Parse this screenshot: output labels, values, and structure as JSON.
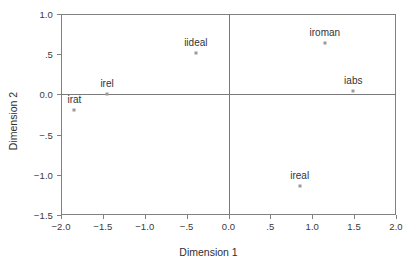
{
  "chart_data": {
    "type": "scatter",
    "title": "",
    "subtitle": "",
    "xlabel": "Dimension 1",
    "ylabel": "Dimension 2",
    "xlim": [
      -2.0,
      2.0
    ],
    "ylim": [
      -1.5,
      1.0
    ],
    "grid": false,
    "legend": "none",
    "reference_lines": {
      "x": 0.0,
      "y": 0.0
    },
    "xticks": [
      -2.0,
      -1.5,
      -1.0,
      -0.5,
      0.0,
      0.5,
      1.0,
      1.5,
      2.0
    ],
    "xtick_labels": [
      "−2.0",
      "−1.5",
      "−1.0",
      "−.5",
      "0.0",
      ".5",
      "1.0",
      "1.5",
      "2.0"
    ],
    "yticks": [
      1.0,
      0.5,
      0.0,
      -0.5,
      -1.0,
      -1.5
    ],
    "ytick_labels": [
      "1.0",
      ".5",
      "0.0",
      "−.5",
      "−1.0",
      "−1.5"
    ],
    "points": [
      {
        "label": "irat",
        "x": -1.84,
        "y": -0.19
      },
      {
        "label": "irel",
        "x": -1.45,
        "y": 0.0
      },
      {
        "label": "iideal",
        "x": -0.39,
        "y": 0.51
      },
      {
        "label": "ireal",
        "x": 0.85,
        "y": -1.14
      },
      {
        "label": "iroman",
        "x": 1.15,
        "y": 0.64
      },
      {
        "label": "iabs",
        "x": 1.49,
        "y": 0.04
      }
    ],
    "colors": {
      "marker": "#9a9a9a",
      "axis": "#808080",
      "reference": "#7a7a7a",
      "text": "#333333",
      "background": "#ffffff"
    }
  }
}
